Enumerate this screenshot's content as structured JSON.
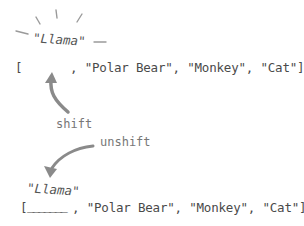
{
  "top": {
    "removed_item": "\"Llama\"",
    "array_open": "[",
    "array_rest": ", \"Polar Bear\", \"Monkey\", \"Cat\"]"
  },
  "operations": {
    "shift_label": "shift",
    "unshift_label": "unshift"
  },
  "bottom": {
    "added_item": "\"Llama\"",
    "array_open": "[",
    "slot": "_______",
    "array_rest": ", \"Polar Bear\", \"Monkey\", \"Cat\"]"
  },
  "colors": {
    "text": "#4a4a4a",
    "arrow": "#8a8a8a",
    "burst": "#999999"
  }
}
